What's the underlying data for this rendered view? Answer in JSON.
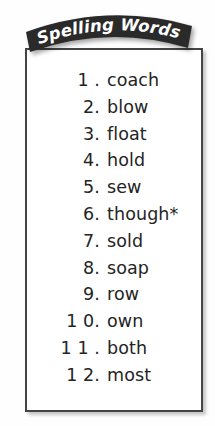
{
  "page": {
    "background_color": "#fefefe",
    "ink_color": "#242424"
  },
  "banner": {
    "title": "Spelling Words",
    "shape": "arched-ribbon",
    "fill_color": "#2b2b2b",
    "text_color": "#ffffff"
  },
  "panel": {
    "border_color": "#444444",
    "background_color": "#ffffff"
  },
  "word_list": {
    "items": [
      {
        "number": "1 .",
        "word": "coach"
      },
      {
        "number": "2.",
        "word": "blow"
      },
      {
        "number": "3.",
        "word": "float"
      },
      {
        "number": "4.",
        "word": "hold"
      },
      {
        "number": "5.",
        "word": "sew"
      },
      {
        "number": "6.",
        "word": "though*"
      },
      {
        "number": "7.",
        "word": "sold"
      },
      {
        "number": "8.",
        "word": "soap"
      },
      {
        "number": "9.",
        "word": "row"
      },
      {
        "number": "1 0.",
        "word": "own"
      },
      {
        "number": "1 1 .",
        "word": "both"
      },
      {
        "number": "1 2.",
        "word": "most"
      }
    ]
  }
}
